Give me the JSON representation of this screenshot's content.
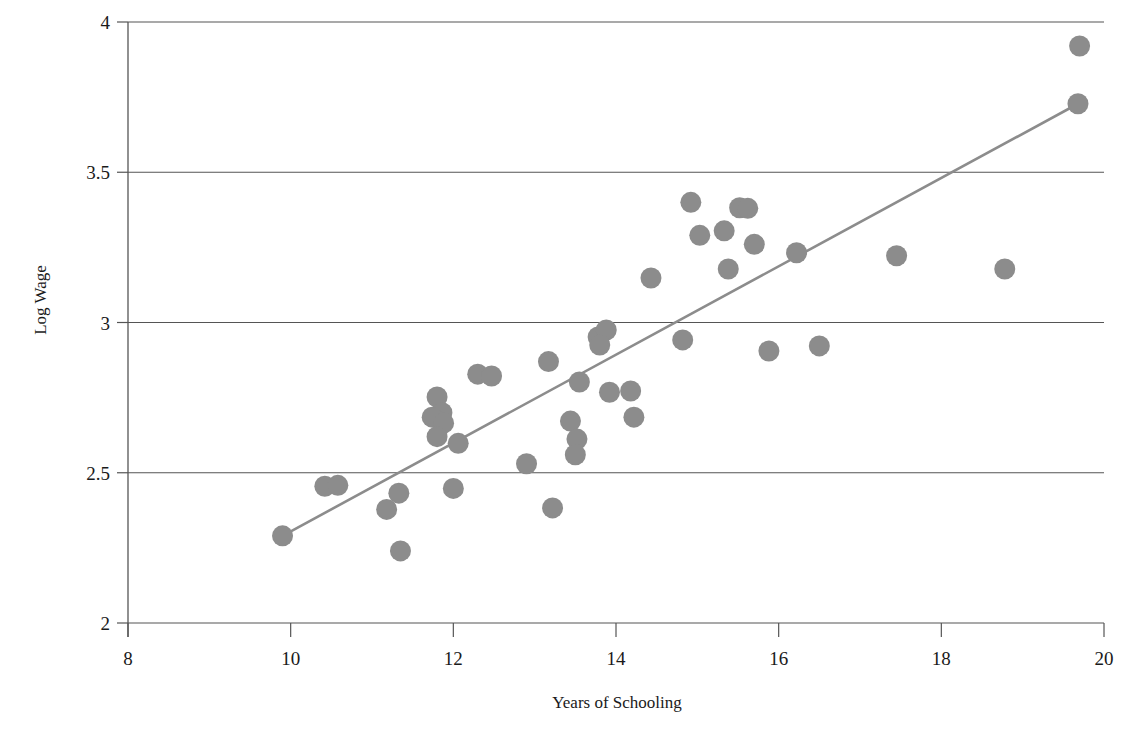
{
  "chart_data": {
    "type": "scatter",
    "title": "",
    "xlabel": "Years of Schooling",
    "ylabel": "Log Wage",
    "xlim": [
      8,
      20
    ],
    "ylim": [
      2,
      4
    ],
    "xticks": [
      8,
      10,
      12,
      14,
      16,
      18,
      20
    ],
    "yticks": [
      2,
      2.5,
      3,
      3.5,
      4
    ],
    "xtick_labels": [
      "8",
      "10",
      "12",
      "14",
      "16",
      "18",
      "20"
    ],
    "ytick_labels": [
      "2",
      "2.5",
      "3",
      "3.5",
      "4"
    ],
    "grid": "horizontal",
    "legend": "none",
    "marker_color": "#8c8c8c",
    "line_color": "#8c8c8c",
    "axis_color": "#555555",
    "points": [
      {
        "x": 9.9,
        "y": 2.29
      },
      {
        "x": 10.42,
        "y": 2.455
      },
      {
        "x": 10.58,
        "y": 2.458
      },
      {
        "x": 11.18,
        "y": 2.378
      },
      {
        "x": 11.33,
        "y": 2.432
      },
      {
        "x": 11.35,
        "y": 2.24
      },
      {
        "x": 11.8,
        "y": 2.752
      },
      {
        "x": 11.86,
        "y": 2.7
      },
      {
        "x": 11.74,
        "y": 2.685
      },
      {
        "x": 11.88,
        "y": 2.665
      },
      {
        "x": 11.8,
        "y": 2.62
      },
      {
        "x": 12.0,
        "y": 2.448
      },
      {
        "x": 12.06,
        "y": 2.598
      },
      {
        "x": 12.3,
        "y": 2.828
      },
      {
        "x": 12.47,
        "y": 2.822
      },
      {
        "x": 12.9,
        "y": 2.53
      },
      {
        "x": 13.17,
        "y": 2.87
      },
      {
        "x": 13.22,
        "y": 2.383
      },
      {
        "x": 13.44,
        "y": 2.672
      },
      {
        "x": 13.52,
        "y": 2.612
      },
      {
        "x": 13.5,
        "y": 2.56
      },
      {
        "x": 13.55,
        "y": 2.802
      },
      {
        "x": 13.78,
        "y": 2.952
      },
      {
        "x": 13.88,
        "y": 2.975
      },
      {
        "x": 13.8,
        "y": 2.925
      },
      {
        "x": 13.92,
        "y": 2.768
      },
      {
        "x": 14.18,
        "y": 2.772
      },
      {
        "x": 14.22,
        "y": 2.685
      },
      {
        "x": 14.43,
        "y": 3.148
      },
      {
        "x": 14.82,
        "y": 2.942
      },
      {
        "x": 14.92,
        "y": 3.4
      },
      {
        "x": 15.03,
        "y": 3.29
      },
      {
        "x": 15.33,
        "y": 3.305
      },
      {
        "x": 15.38,
        "y": 3.178
      },
      {
        "x": 15.52,
        "y": 3.382
      },
      {
        "x": 15.62,
        "y": 3.38
      },
      {
        "x": 15.7,
        "y": 3.26
      },
      {
        "x": 15.88,
        "y": 2.905
      },
      {
        "x": 16.22,
        "y": 3.232
      },
      {
        "x": 16.5,
        "y": 2.922
      },
      {
        "x": 17.45,
        "y": 3.222
      },
      {
        "x": 18.78,
        "y": 3.178
      },
      {
        "x": 19.7,
        "y": 3.92
      },
      {
        "x": 19.68,
        "y": 3.728
      }
    ],
    "fit_line": {
      "x0": 9.9,
      "y0": 2.29,
      "x1": 19.68,
      "y1": 3.728
    }
  }
}
